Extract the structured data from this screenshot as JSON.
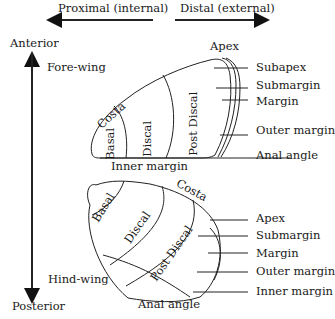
{
  "axes": {
    "proximal": "Proximal (internal)",
    "distal": "Distal (external)",
    "anterior": "Anterior",
    "posterior": "Posterior"
  },
  "forewing": {
    "title": "Fore-wing",
    "regions": {
      "costa": "Costa",
      "basal": "Basal",
      "discal": "Discal",
      "postdiscal": "Post Discal",
      "inner_margin": "Inner margin"
    },
    "callouts": [
      "Apex",
      "Subapex",
      "Submargin",
      "Margin",
      "Outer margin",
      "Anal angle"
    ]
  },
  "hindwing": {
    "title": "Hind-wing",
    "regions": {
      "costa": "Costa",
      "basal": "Basal",
      "discal": "Discal",
      "postdiscal": "Post Discal",
      "anal_angle": "Anal angle"
    },
    "callouts": [
      "Apex",
      "Submargin",
      "Margin",
      "Outer margin",
      "Inner margin"
    ]
  }
}
